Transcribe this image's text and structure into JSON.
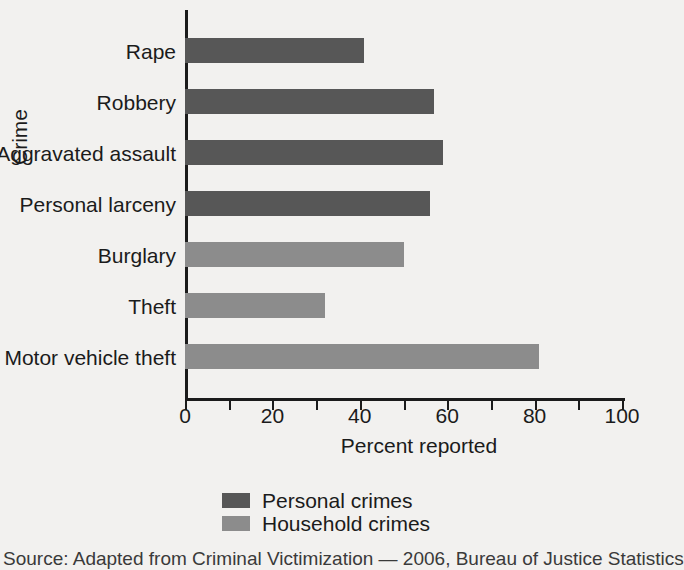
{
  "chart_data": {
    "type": "bar",
    "orientation": "horizontal",
    "title": "",
    "xlabel": "Percent reported",
    "ylabel": "Crime",
    "xlim": [
      0,
      100
    ],
    "xticks": [
      0,
      20,
      40,
      60,
      80,
      100
    ],
    "xtick_labels": [
      "0",
      "20",
      "40",
      "60",
      "80",
      "100"
    ],
    "minor_tick_interval": 10,
    "grid": false,
    "legend_position": "below-axes",
    "categories": [
      "Rape",
      "Robbery",
      "Aggravated assault",
      "Personal larceny",
      "Burglary",
      "Theft",
      "Motor vehicle theft"
    ],
    "values": [
      41,
      57,
      59,
      56,
      50,
      32,
      81
    ],
    "groups": [
      "Personal crimes",
      "Personal crimes",
      "Personal crimes",
      "Personal crimes",
      "Household crimes",
      "Household crimes",
      "Household crimes"
    ],
    "series": [
      {
        "name": "Personal crimes",
        "color": "#575757",
        "points": [
          {
            "category": "Rape",
            "value": 41
          },
          {
            "category": "Robbery",
            "value": 57
          },
          {
            "category": "Aggravated assault",
            "value": 59
          },
          {
            "category": "Personal larceny",
            "value": 56
          }
        ]
      },
      {
        "name": "Household crimes",
        "color": "#8c8c8c",
        "points": [
          {
            "category": "Burglary",
            "value": 50
          },
          {
            "category": "Theft",
            "value": 32
          },
          {
            "category": "Motor vehicle theft",
            "value": 81
          }
        ]
      }
    ],
    "legend": [
      {
        "label": "Personal crimes",
        "color": "#575757"
      },
      {
        "label": "Household crimes",
        "color": "#8c8c8c"
      }
    ]
  },
  "axes": {
    "x_title": "Percent reported",
    "y_title": "Crime",
    "x_tick_labels": [
      "0",
      "20",
      "40",
      "60",
      "80",
      "100"
    ]
  },
  "bars": [
    {
      "label": "Rape",
      "value": 41,
      "group": "Personal crimes"
    },
    {
      "label": "Robbery",
      "value": 57,
      "group": "Personal crimes"
    },
    {
      "label": "Aggravated assault",
      "value": 59,
      "group": "Personal crimes"
    },
    {
      "label": "Personal larceny",
      "value": 56,
      "group": "Personal crimes"
    },
    {
      "label": "Burglary",
      "value": 50,
      "group": "Household crimes"
    },
    {
      "label": "Theft",
      "value": 32,
      "group": "Household crimes"
    },
    {
      "label": "Motor vehicle theft",
      "value": 81,
      "group": "Household crimes"
    }
  ],
  "legend": {
    "personal_label": "Personal crimes",
    "household_label": "Household crimes"
  },
  "source": {
    "note": "Source: Adapted from Criminal Victimization — 2006, Bureau of Justice Statistics"
  },
  "colors": {
    "personal": "#575757",
    "household": "#8c8c8c",
    "background": "#f2f1ef",
    "ink": "#1b1b1b"
  }
}
